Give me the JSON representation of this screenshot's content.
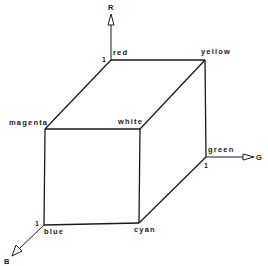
{
  "diagram": {
    "axes": {
      "r": {
        "label": "R",
        "tick": "1"
      },
      "g": {
        "label": "G",
        "tick": "1"
      },
      "b": {
        "label": "B",
        "tick": "1"
      }
    },
    "vertices": {
      "red": "red",
      "yellow": "yellow",
      "magenta": "magenta",
      "white": "white",
      "green": "green",
      "blue": "blue",
      "cyan": "cyan"
    },
    "line_color": "#1a1a1a",
    "background": "#ffffff"
  }
}
